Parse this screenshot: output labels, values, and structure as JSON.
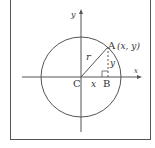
{
  "diagram": {
    "title": "",
    "labels": {
      "y_axis": "y",
      "x_axis": "x",
      "point_a": "A",
      "point_a_coords": "(x, y)",
      "point_b": "B",
      "center": "C",
      "radius": "r",
      "horizontal_leg": "x",
      "vertical_leg": "y"
    },
    "colors": {
      "stroke": "#555555",
      "text": "#333333",
      "background": "#ffffff"
    }
  }
}
